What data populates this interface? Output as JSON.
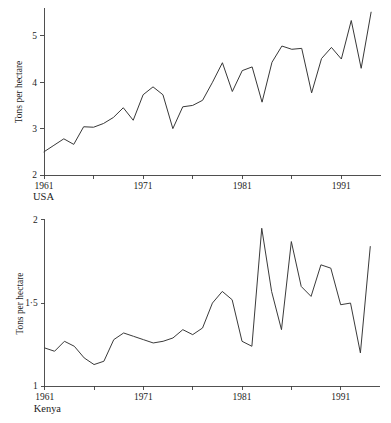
{
  "figure": {
    "background_color": "#ffffff",
    "line_color": "#383838",
    "axis_color": "#3c3c3c",
    "text_color": "#1c1c1c"
  },
  "chart_data": [
    {
      "type": "line",
      "name": "usa",
      "title": "",
      "caption": "USA",
      "xlabel": "",
      "ylabel": "Tons per hectare",
      "xlim": [
        1961,
        1995
      ],
      "ylim": [
        2,
        5.6
      ],
      "grid": false,
      "legend": "none",
      "y_ticks": [
        2,
        3,
        4,
        5
      ],
      "y_tick_labels": [
        "2",
        "3",
        "4",
        "5"
      ],
      "x_ticks": [
        1961,
        1966,
        1971,
        1976,
        1981,
        1986,
        1991
      ],
      "x_tick_labels": [
        "1961",
        "",
        "1971",
        "",
        "1981",
        "",
        "1991"
      ],
      "x": [
        1961,
        1962,
        1963,
        1964,
        1965,
        1966,
        1967,
        1968,
        1969,
        1970,
        1971,
        1972,
        1973,
        1974,
        1975,
        1976,
        1977,
        1978,
        1979,
        1980,
        1981,
        1982,
        1983,
        1984,
        1985,
        1986,
        1987,
        1988,
        1989,
        1990,
        1991,
        1992,
        1993,
        1994
      ],
      "values": [
        2.5,
        2.64,
        2.78,
        2.66,
        3.04,
        3.03,
        3.11,
        3.24,
        3.45,
        3.18,
        3.73,
        3.9,
        3.73,
        3.0,
        3.47,
        3.5,
        3.61,
        4.0,
        4.42,
        3.8,
        4.25,
        4.33,
        3.57,
        4.43,
        4.78,
        4.71,
        4.73,
        3.77,
        4.51,
        4.75,
        4.5,
        5.33,
        4.3,
        5.51
      ]
    },
    {
      "type": "line",
      "name": "kenya",
      "title": "",
      "caption": "Kenya",
      "xlabel": "",
      "ylabel": "Tons per hectare",
      "xlim": [
        1961,
        1995
      ],
      "ylim": [
        1,
        2
      ],
      "grid": false,
      "legend": "none",
      "y_ticks": [
        1,
        1.5,
        2
      ],
      "y_tick_labels": [
        "1",
        "1·5",
        "2"
      ],
      "x_ticks": [
        1961,
        1966,
        1971,
        1976,
        1981,
        1986,
        1991
      ],
      "x_tick_labels": [
        "1961",
        "",
        "1971",
        "",
        "1981",
        "",
        "1991"
      ],
      "x": [
        1961,
        1962,
        1963,
        1964,
        1965,
        1966,
        1967,
        1968,
        1969,
        1970,
        1971,
        1972,
        1973,
        1974,
        1975,
        1976,
        1977,
        1978,
        1979,
        1980,
        1981,
        1982,
        1983,
        1984,
        1985,
        1986,
        1987,
        1988,
        1989,
        1990,
        1991,
        1992,
        1993,
        1994
      ],
      "values": [
        1.23,
        1.21,
        1.27,
        1.24,
        1.17,
        1.13,
        1.15,
        1.28,
        1.32,
        1.3,
        1.28,
        1.26,
        1.27,
        1.29,
        1.34,
        1.31,
        1.35,
        1.5,
        1.57,
        1.52,
        1.27,
        1.24,
        1.95,
        1.57,
        1.34,
        1.87,
        1.6,
        1.54,
        1.73,
        1.71,
        1.49,
        1.5,
        1.2,
        1.84
      ]
    }
  ]
}
